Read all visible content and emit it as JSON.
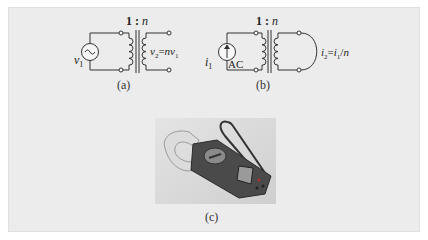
{
  "figure": {
    "panel_a": {
      "ratio_label": "1 : n",
      "source_label": "v",
      "source_sub": "1",
      "output_label": "v",
      "output_sub": "2",
      "output_eq": "=nv",
      "output_eq_sub": "1",
      "caption": "(a)"
    },
    "panel_b": {
      "ratio_label": "1 : n",
      "source_label": "i",
      "source_sub": "1",
      "source_type": "AC",
      "output_label": "i",
      "output_sub": "2",
      "output_eq": "=i",
      "output_eq_sub": "1",
      "output_eq_tail": "/n",
      "caption": "(b)"
    },
    "panel_c": {
      "photo_subject": "clamp meter",
      "caption": "(c)"
    }
  }
}
